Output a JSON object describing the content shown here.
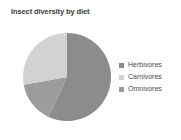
{
  "chart_data": {
    "type": "pie",
    "title": "Insect diversity by diet",
    "xlabel": "",
    "ylabel": "",
    "legend_position": "right",
    "grid": false,
    "categories": [
      "Herbivores",
      "Carnivores",
      "Omnivores"
    ],
    "values": [
      57,
      28,
      15
    ],
    "slices": [
      {
        "label": "Herbivores",
        "value": 57,
        "color": "#8c8c8c",
        "start_angle_deg": 0,
        "sweep_deg": 205
      },
      {
        "label": "Omnivores",
        "value": 15,
        "color": "#9c9c9c",
        "start_angle_deg": 205,
        "sweep_deg": 55
      },
      {
        "label": "Carnivores",
        "value": 28,
        "color": "#d2d2d2",
        "start_angle_deg": 260,
        "sweep_deg": 100
      }
    ],
    "colors": {
      "herbivores": "#8c8c8c",
      "carnivores": "#d2d2d2",
      "omnivores": "#9c9c9c",
      "title_text": "#3a3a3a",
      "legend_text": "#4a4a4a",
      "background": "#ffffff"
    }
  },
  "legend": {
    "entries": [
      {
        "label": "Herbivores",
        "color": "#8c8c8c"
      },
      {
        "label": "Carnivores",
        "color": "#d2d2d2"
      },
      {
        "label": "Omnivores",
        "color": "#9c9c9c"
      }
    ]
  }
}
